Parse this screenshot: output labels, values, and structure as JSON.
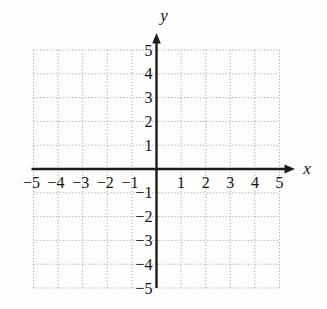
{
  "figure": {
    "background": "#fdfdfc",
    "axis_color": "#1c1c1c",
    "grid_color": "#9c9c9c",
    "label_color": "#141414"
  },
  "chart_data": {
    "type": "scatter",
    "title": "",
    "subtitle": "",
    "xlabel": "x",
    "ylabel": "y",
    "xlim": [
      -5,
      5
    ],
    "ylim": [
      -5,
      5
    ],
    "grid": true,
    "grid_style": "dotted",
    "legend": "none",
    "series": [],
    "x_tick_values": [
      -5,
      -4,
      -3,
      -2,
      -1,
      1,
      2,
      3,
      4,
      5
    ],
    "x_tick_labels": [
      "−5",
      "−4",
      "−3",
      "−2",
      "−1",
      "1",
      "2",
      "3",
      "4",
      "5"
    ],
    "y_tick_values": [
      -5,
      -4,
      -3,
      -2,
      -1,
      1,
      2,
      3,
      4,
      5
    ],
    "y_tick_labels": [
      "−5",
      "−4",
      "−3",
      "−2",
      "−1",
      "1",
      "2",
      "3",
      "4",
      "5"
    ]
  }
}
